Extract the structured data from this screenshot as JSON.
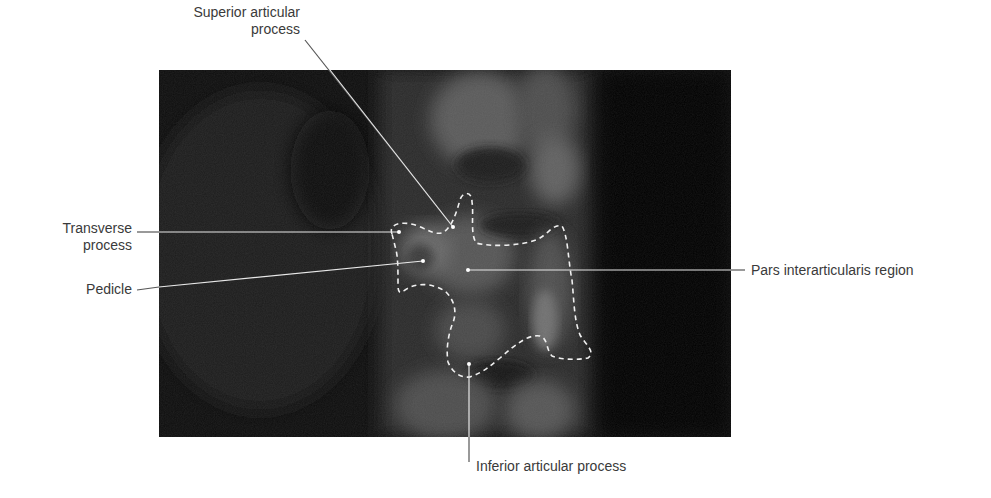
{
  "figure": {
    "type": "annotated radiograph",
    "colors": {
      "background": "#ffffff",
      "xray_base": "#0c0c0c",
      "leader_line": "#e8e8e8",
      "leader_line_outside": "#555555",
      "outline": "#f0f0f0",
      "text": "#3a3a3a"
    },
    "labels": [
      {
        "id": "superior",
        "line1": "Superior articular",
        "line2": "process"
      },
      {
        "id": "transverse",
        "line1": "Transverse",
        "line2": "process"
      },
      {
        "id": "pedicle",
        "line1": "Pedicle"
      },
      {
        "id": "pars",
        "line1": "Pars interarticularis region"
      },
      {
        "id": "inferior",
        "line1": "Inferior articular process"
      }
    ]
  }
}
